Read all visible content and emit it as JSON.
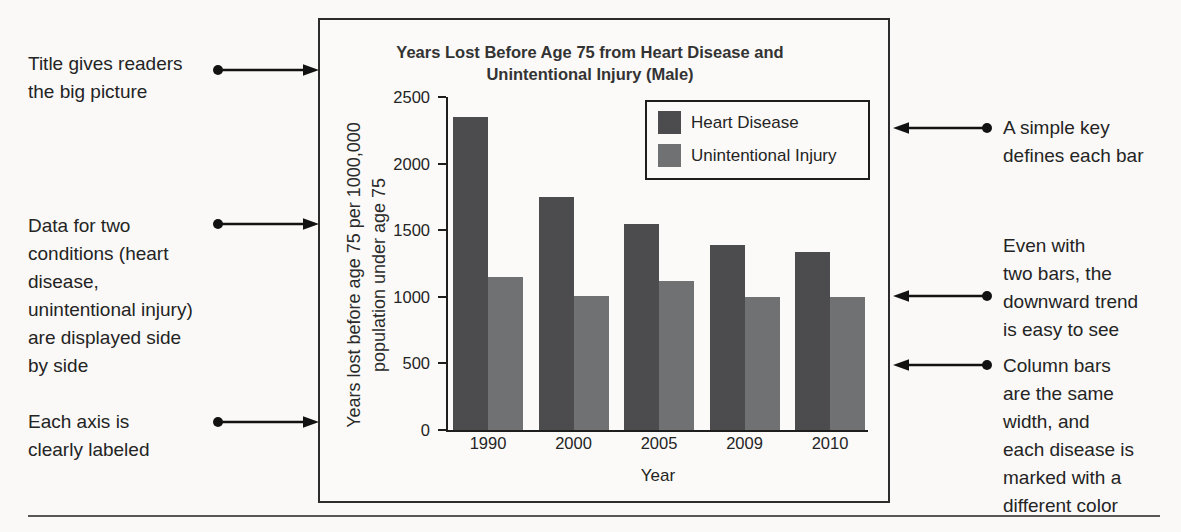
{
  "page": {
    "background": "#faf9f7",
    "ink": "#242424",
    "rule_color": "#575757"
  },
  "annotations": {
    "left": [
      {
        "lines": [
          "Title gives readers",
          "the big picture"
        ]
      },
      {
        "lines": [
          "Data for two",
          "conditions (heart",
          "disease,",
          "unintentional injury)",
          "are displayed side",
          "by side"
        ]
      },
      {
        "lines": [
          "Each axis is",
          "clearly labeled"
        ]
      }
    ],
    "right": [
      {
        "lines": [
          "A simple key",
          "defines each bar"
        ]
      },
      {
        "lines": [
          "Even with",
          "two bars, the",
          "downward trend",
          "is easy to see"
        ]
      },
      {
        "lines": [
          "Column bars",
          "are the same",
          "width, and",
          "each disease is",
          "marked with a",
          "different color"
        ]
      }
    ]
  },
  "chart_data": {
    "type": "bar",
    "title": "Years Lost Before Age 75 from Heart Disease and Unintentional Injury (Male)",
    "title_lines": [
      "Years Lost Before Age 75 from Heart Disease and",
      "Unintentional Injury (Male)"
    ],
    "categories": [
      "1990",
      "2000",
      "2005",
      "2009",
      "2010"
    ],
    "series": [
      {
        "name": "Heart Disease",
        "color": "#4c4c4e",
        "values": [
          2350,
          1750,
          1550,
          1390,
          1340
        ]
      },
      {
        "name": "Unintentional Injury",
        "color": "#707173",
        "values": [
          1150,
          1010,
          1120,
          1000,
          1000
        ]
      }
    ],
    "xlabel": "Year",
    "ylabel": "Years lost before age 75 per 1000,000 population under age 75",
    "ylabel_lines": [
      "Years lost before age 75 per 1000,000",
      "population under age 75"
    ],
    "ylim": [
      0,
      2500
    ],
    "yticks": [
      2500,
      2000,
      1500,
      1000,
      500,
      0
    ],
    "grid": false,
    "legend_position": "top-right"
  }
}
